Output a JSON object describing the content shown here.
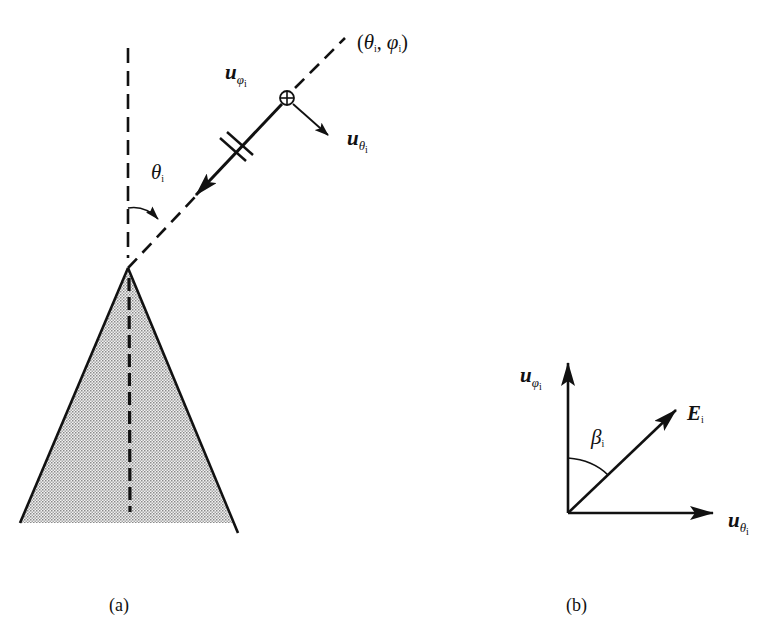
{
  "figure": {
    "panel_a": {
      "caption": "(a)",
      "direction_label": "(θi, φi)",
      "direction_label_parts": {
        "open": "(",
        "theta": "θ",
        "theta_sub": "i",
        "sep": ", ",
        "phi": "φ",
        "phi_sub": "i",
        "close": ")"
      },
      "u_phi_label": {
        "base": "u",
        "sub": "φ",
        "subsub": "i"
      },
      "u_theta_label": {
        "base": "u",
        "sub": "θ",
        "subsub": "i"
      },
      "angle_label": {
        "base": "θ",
        "sub": "i"
      },
      "elements": [
        "cone (shaded)",
        "cone axis (dashed)",
        "vertical reference (dashed)",
        "incidence direction (dashed)",
        "incident wave arrow with polarization mark",
        "⊕ out-of-plane vector",
        "u_theta arrow",
        "angle arc θi"
      ]
    },
    "panel_b": {
      "caption": "(b)",
      "u_phi_label": {
        "base": "u",
        "sub": "φ",
        "subsub": "i"
      },
      "u_theta_label": {
        "base": "u",
        "sub": "θ",
        "subsub": "i"
      },
      "e_label": {
        "base": "E",
        "sub": "i"
      },
      "angle_label": {
        "base": "β",
        "sub": "i"
      }
    },
    "colors": {
      "ink": "#111111",
      "shade": "#d8d8d8",
      "background": "#ffffff"
    }
  }
}
